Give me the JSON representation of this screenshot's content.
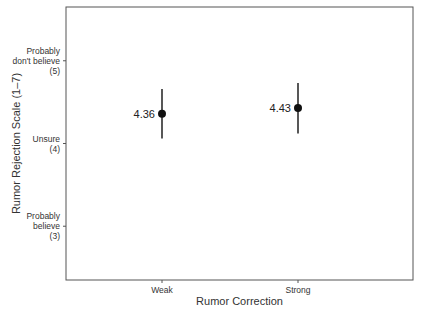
{
  "chart_data": {
    "type": "scatter",
    "subtype": "point-with-error-bars",
    "title": "",
    "xlabel": "Rumor Correction",
    "ylabel": "Rumor Rejection Scale (1–7)",
    "categories": [
      "Weak",
      "Strong"
    ],
    "values": [
      4.36,
      4.43
    ],
    "value_labels": [
      "4.36",
      "4.43"
    ],
    "error_bars": [
      {
        "low": 4.06,
        "high": 4.66
      },
      {
        "low": 4.12,
        "high": 4.73
      }
    ],
    "y_ticks": [
      {
        "value": 5,
        "label_lines": [
          "Probably",
          "don't believe",
          "(5)"
        ]
      },
      {
        "value": 4,
        "label_lines": [
          "Unsure",
          "(4)"
        ]
      },
      {
        "value": 3,
        "label_lines": [
          "Probably",
          "believe",
          "(3)"
        ]
      }
    ],
    "ylim": [
      2.35,
      5.65
    ],
    "grid": false,
    "legend": null
  },
  "colors": {
    "point": "#111111",
    "frame": "#555555",
    "text": "#333333"
  }
}
